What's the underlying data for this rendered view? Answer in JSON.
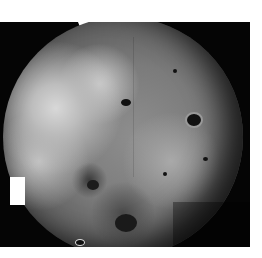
{
  "image": {
    "subject": "grayscale mosaic photograph of a cratered planetary moon",
    "background_color": "#ffffff",
    "space_color": "#050505"
  }
}
